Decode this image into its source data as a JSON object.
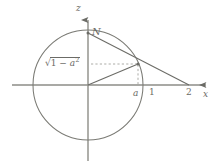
{
  "figure": {
    "width": 224,
    "height": 167,
    "background_color": "#ffffff",
    "stroke_color": "#6b6b66",
    "dashed_color": "#9a9a94"
  },
  "axes": {
    "vertical": {
      "label": "z",
      "x": 88,
      "top_y": 14,
      "bottom_y": 161,
      "arrow": "up"
    },
    "horizontal": {
      "label": "x",
      "y": 85,
      "left_x": 12,
      "right_x": 212,
      "arrow": "right"
    },
    "ticks": [
      {
        "label": "a",
        "x": 138,
        "italic": true
      },
      {
        "label": "1",
        "x": 153,
        "italic": false
      },
      {
        "label": "2",
        "x": 189,
        "italic": false
      }
    ]
  },
  "circle": {
    "center_x": 88,
    "center_y": 85,
    "radius": 55,
    "description": "unit circle"
  },
  "points": {
    "north_pole": {
      "label": "N",
      "x": 88,
      "y": 33
    },
    "projection_point": {
      "label": "",
      "x": 138,
      "y": 64
    },
    "origin": {
      "label": "",
      "x": 88,
      "y": 85
    },
    "axis_intersection": {
      "label": "2",
      "x": 189,
      "y": 85
    }
  },
  "segments": [
    {
      "name": "ray-n-to-axis",
      "from": "north_pole",
      "to": "axis_intersection",
      "style": "solid"
    },
    {
      "name": "radius-origin-to-point",
      "from": "origin",
      "to": "projection_point",
      "style": "solid"
    }
  ],
  "dashed_guides": [
    {
      "name": "horizontal-height-guide",
      "from_x": 90,
      "to_x": 138,
      "y": 64
    },
    {
      "name": "vertical-drop-guide",
      "x": 138,
      "from_y": 64,
      "to_y": 85
    }
  ],
  "labels": {
    "height_expression": {
      "prefix": "√",
      "radicand_one": "1",
      "minus": " − ",
      "variable": "a",
      "exponent": "2",
      "plain_text": "√(1 − a²)"
    }
  }
}
